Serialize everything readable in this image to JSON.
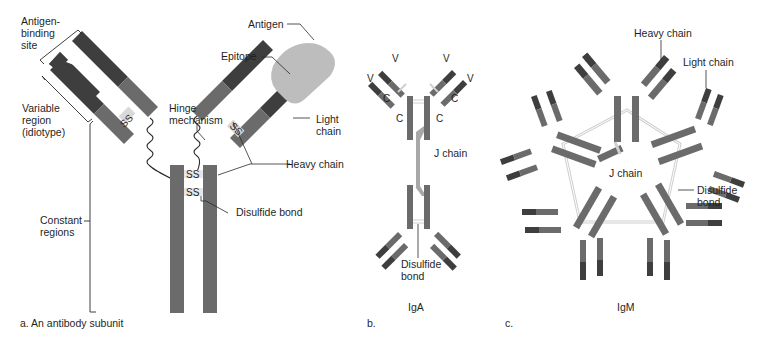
{
  "colors": {
    "constant": "#6b6b6b",
    "variable": "#3e3e3e",
    "antigen": "#bdbdbd",
    "bond": "#d9d9d9",
    "line": "#2a2a2a"
  },
  "panel_a": {
    "caption": "a. An antibody subunit",
    "labels": {
      "antigen_binding_site_1": "Antigen-",
      "antigen_binding_site_2": "binding",
      "antigen_binding_site_3": "site",
      "variable_region_1": "Variable",
      "variable_region_2": "region",
      "variable_region_3": "(idiotype)",
      "constant_regions_1": "Constant",
      "constant_regions_2": "regions",
      "hinge_1": "Hinge",
      "hinge_2": "mechanism",
      "antigen": "Antigen",
      "epitope": "Epitope",
      "light_chain_1": "Light",
      "light_chain_2": "chain",
      "heavy_chain": "Heavy chain",
      "disulfide_bond": "Disulfide bond",
      "ss": "SS"
    }
  },
  "panel_b": {
    "caption": "b.",
    "title": "IgA",
    "labels": {
      "v": "V",
      "c": "C",
      "j_chain": "J chain",
      "disulfide_1": "Disulfide",
      "disulfide_2": "bond"
    }
  },
  "panel_c": {
    "caption": "c.",
    "title": "IgM",
    "labels": {
      "heavy_chain": "Heavy chain",
      "light_chain": "Light chain",
      "j_chain": "J chain",
      "disulfide_1": "Disulfide",
      "disulfide_2": "bond"
    }
  }
}
